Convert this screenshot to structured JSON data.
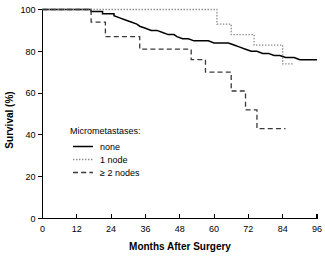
{
  "chart_data": {
    "type": "line",
    "subtype": "kaplan-meier-step",
    "title": "",
    "xlabel": "Months After Surgery",
    "ylabel": "Survival (%)",
    "xlim": [
      0,
      96
    ],
    "ylim": [
      0,
      100
    ],
    "xticks": [
      0,
      12,
      24,
      36,
      48,
      60,
      72,
      84,
      96
    ],
    "xtick_labels": [
      "0",
      "12",
      "24",
      "36",
      "48",
      "60",
      "72",
      "84",
      "96"
    ],
    "yticks": [
      0,
      20,
      40,
      60,
      80,
      100
    ],
    "ytick_labels": [
      "0",
      "20",
      "40",
      "60",
      "80",
      "100"
    ],
    "grid": false,
    "legend_position": "inside-left-lower",
    "legend_title": "Micrometastases:",
    "series": [
      {
        "name": "none",
        "style": "solid",
        "color": "#000000",
        "points": [
          [
            0,
            100
          ],
          [
            17,
            100
          ],
          [
            17,
            99
          ],
          [
            21,
            99
          ],
          [
            21,
            98
          ],
          [
            25,
            98
          ],
          [
            25,
            97
          ],
          [
            27,
            96
          ],
          [
            29,
            95
          ],
          [
            31,
            94
          ],
          [
            33,
            93
          ],
          [
            34,
            92
          ],
          [
            36,
            91
          ],
          [
            38,
            90
          ],
          [
            40,
            90
          ],
          [
            42,
            89
          ],
          [
            44,
            88
          ],
          [
            46,
            88
          ],
          [
            47,
            87
          ],
          [
            49,
            86
          ],
          [
            51,
            86
          ],
          [
            53,
            85
          ],
          [
            56,
            85
          ],
          [
            58,
            85
          ],
          [
            60,
            84
          ],
          [
            63,
            84
          ],
          [
            65,
            84
          ],
          [
            67,
            83
          ],
          [
            69,
            82
          ],
          [
            71,
            81
          ],
          [
            73,
            80
          ],
          [
            75,
            80
          ],
          [
            77,
            79
          ],
          [
            79,
            79
          ],
          [
            81,
            78
          ],
          [
            83,
            78
          ],
          [
            85,
            77
          ],
          [
            88,
            77
          ],
          [
            90,
            76
          ],
          [
            96,
            76
          ]
        ]
      },
      {
        "name": "1 node",
        "style": "dotted",
        "color": "#8a8a8a",
        "points": [
          [
            0,
            100
          ],
          [
            61,
            100
          ],
          [
            61,
            93
          ],
          [
            66,
            93
          ],
          [
            66,
            88
          ],
          [
            74,
            88
          ],
          [
            74,
            83
          ],
          [
            84,
            83
          ],
          [
            84,
            74
          ],
          [
            88,
            74
          ]
        ]
      },
      {
        "name": "≥ 2 nodes",
        "style": "dashed",
        "color": "#3a3a3a",
        "points": [
          [
            0,
            100
          ],
          [
            17,
            100
          ],
          [
            17,
            94
          ],
          [
            22,
            94
          ],
          [
            22,
            87
          ],
          [
            34,
            87
          ],
          [
            34,
            81
          ],
          [
            52,
            81
          ],
          [
            52,
            76
          ],
          [
            57,
            76
          ],
          [
            57,
            70
          ],
          [
            66,
            70
          ],
          [
            66,
            61
          ],
          [
            71,
            61
          ],
          [
            71,
            52
          ],
          [
            75,
            52
          ],
          [
            75,
            43
          ],
          [
            85,
            43
          ]
        ]
      }
    ],
    "legend_entries": [
      {
        "label": "none",
        "style": "solid"
      },
      {
        "label": "1 node",
        "style": "dotted"
      },
      {
        "label": "≥ 2 nodes",
        "style": "dashed"
      }
    ]
  }
}
